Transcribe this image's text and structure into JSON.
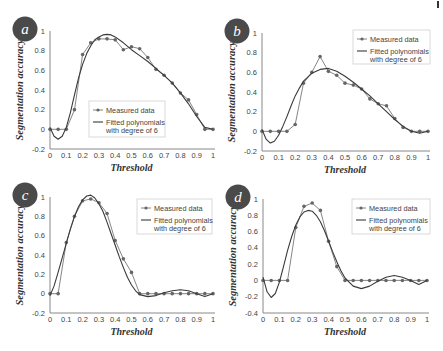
{
  "figure": {
    "corner_mark": true
  },
  "chart_data": [
    {
      "id": "a",
      "panel_label": "a",
      "type": "line",
      "title": "",
      "xlabel": "Threshold",
      "ylabel": "Segmentation accuracy",
      "xlim": [
        0,
        1
      ],
      "ylim": [
        -0.2,
        1
      ],
      "xticks": [
        "0",
        "0.1",
        "0.2",
        "0.3",
        "0.4",
        "0.5",
        "0.6",
        "0.7",
        "0.8",
        "0.9",
        "1"
      ],
      "yticks": [
        "-0.2",
        "0",
        "0.2",
        "0.4",
        "0.6",
        "0.8",
        "1"
      ],
      "grid": false,
      "legend": {
        "position": "lower-center",
        "entries": [
          "Measured data",
          "Fitted polynomials with degree of 6"
        ]
      },
      "series": [
        {
          "name": "Measured data",
          "style": "line-marker",
          "x": [
            0,
            0.05,
            0.1,
            0.15,
            0.2,
            0.25,
            0.3,
            0.35,
            0.4,
            0.45,
            0.5,
            0.55,
            0.6,
            0.65,
            0.7,
            0.75,
            0.8,
            0.85,
            0.9,
            0.95,
            1
          ],
          "y": [
            0,
            0,
            0,
            0.2,
            0.76,
            0.88,
            0.92,
            0.92,
            0.91,
            0.81,
            0.84,
            0.82,
            0.73,
            0.61,
            0.55,
            0.47,
            0.37,
            0.3,
            0.15,
            0,
            0
          ]
        },
        {
          "name": "Fitted polynomials with degree of 6",
          "style": "line",
          "x": [
            0,
            0.025,
            0.05,
            0.075,
            0.1,
            0.125,
            0.15,
            0.175,
            0.2,
            0.225,
            0.25,
            0.275,
            0.3,
            0.325,
            0.35,
            0.375,
            0.4,
            0.45,
            0.5,
            0.55,
            0.6,
            0.65,
            0.7,
            0.75,
            0.8,
            0.85,
            0.9,
            0.95,
            1
          ],
          "y": [
            0.02,
            -0.07,
            -0.1,
            -0.07,
            0.02,
            0.17,
            0.35,
            0.52,
            0.66,
            0.77,
            0.85,
            0.91,
            0.94,
            0.96,
            0.965,
            0.96,
            0.94,
            0.88,
            0.81,
            0.75,
            0.69,
            0.62,
            0.55,
            0.47,
            0.37,
            0.26,
            0.13,
            0.02,
            0
          ]
        }
      ],
      "legend_box": {
        "x": 89,
        "y": 101,
        "w": 76,
        "h": 36
      },
      "plot": {
        "x0": 50,
        "x1": 213,
        "y_top": 31,
        "y_bottom": 149
      }
    },
    {
      "id": "b",
      "panel_label": "b",
      "type": "line",
      "title": "",
      "xlabel": "Threshold",
      "ylabel": "Segmentation accuracy",
      "xlim": [
        0,
        1
      ],
      "ylim": [
        -0.2,
        1
      ],
      "xticks": [
        "0",
        "0.1",
        "0.2",
        "0.3",
        "0.4",
        "0.5",
        "0.6",
        "0.7",
        "0.8",
        "0.9",
        "1"
      ],
      "yticks": [
        "-0.2",
        "0",
        "0.2",
        "0.4",
        "0.6",
        "0.8",
        "1"
      ],
      "grid": false,
      "legend": {
        "position": "upper-right",
        "entries": [
          "Measured data",
          "Fitted polynomials with degree of 6"
        ]
      },
      "series": [
        {
          "name": "Measured data",
          "style": "line-marker",
          "x": [
            0,
            0.05,
            0.1,
            0.15,
            0.2,
            0.25,
            0.3,
            0.35,
            0.4,
            0.45,
            0.5,
            0.55,
            0.6,
            0.65,
            0.7,
            0.75,
            0.8,
            0.85,
            0.9,
            0.95,
            1
          ],
          "y": [
            0,
            0,
            0,
            0,
            0.07,
            0.49,
            0.6,
            0.76,
            0.61,
            0.57,
            0.49,
            0.47,
            0.43,
            0.33,
            0.28,
            0.26,
            0.13,
            0.04,
            0,
            0,
            0
          ]
        },
        {
          "name": "Fitted polynomials with degree of 6",
          "style": "line",
          "x": [
            0,
            0.025,
            0.05,
            0.075,
            0.1,
            0.125,
            0.15,
            0.175,
            0.2,
            0.225,
            0.25,
            0.3,
            0.35,
            0.4,
            0.45,
            0.5,
            0.55,
            0.6,
            0.65,
            0.7,
            0.75,
            0.8,
            0.85,
            0.9,
            0.95,
            1
          ],
          "y": [
            0.02,
            -0.08,
            -0.12,
            -0.1,
            -0.04,
            0.05,
            0.15,
            0.26,
            0.36,
            0.44,
            0.51,
            0.59,
            0.63,
            0.64,
            0.61,
            0.56,
            0.5,
            0.43,
            0.36,
            0.28,
            0.2,
            0.12,
            0.05,
            0.0,
            -0.02,
            0
          ]
        }
      ],
      "legend_box": {
        "x": 353,
        "y": 30,
        "w": 77,
        "h": 34
      },
      "plot": {
        "x0": 262,
        "x1": 428,
        "y_top": 33,
        "y_bottom": 151
      }
    },
    {
      "id": "c",
      "panel_label": "c",
      "type": "line",
      "title": "",
      "xlabel": "Threshold",
      "ylabel": "Segmentation accuracy",
      "xlim": [
        0,
        1
      ],
      "ylim": [
        -0.2,
        1
      ],
      "xticks": [
        "0",
        "0.1",
        "0.2",
        "0.3",
        "0.4",
        "0.5",
        "0.6",
        "0.7",
        "0.8",
        "0.9",
        "1"
      ],
      "yticks": [
        "-0.2",
        "0",
        "0.2",
        "0.4",
        "0.6",
        "0.8",
        "1"
      ],
      "grid": false,
      "legend": {
        "position": "upper-right",
        "entries": [
          "Measured data",
          "Fitted polynomials with degree of 6"
        ]
      },
      "series": [
        {
          "name": "Measured data",
          "style": "line-marker",
          "x": [
            0,
            0.05,
            0.1,
            0.15,
            0.2,
            0.25,
            0.3,
            0.35,
            0.4,
            0.45,
            0.5,
            0.55,
            0.6,
            0.65,
            0.7,
            0.75,
            0.8,
            0.85,
            0.9,
            0.95,
            1
          ],
          "y": [
            0,
            0,
            0.53,
            0.8,
            0.96,
            0.98,
            0.94,
            0.83,
            0.55,
            0.36,
            0.22,
            0,
            0,
            0,
            0,
            0,
            0,
            0,
            0,
            0,
            0
          ]
        },
        {
          "name": "Fitted polynomials with degree of 6",
          "style": "line",
          "x": [
            0,
            0.025,
            0.05,
            0.075,
            0.1,
            0.125,
            0.15,
            0.175,
            0.2,
            0.225,
            0.25,
            0.275,
            0.3,
            0.325,
            0.35,
            0.375,
            0.4,
            0.425,
            0.45,
            0.475,
            0.5,
            0.525,
            0.55,
            0.6,
            0.65,
            0.7,
            0.75,
            0.8,
            0.85,
            0.9,
            0.95,
            1
          ],
          "y": [
            -0.02,
            0.08,
            0.22,
            0.37,
            0.52,
            0.67,
            0.8,
            0.9,
            0.97,
            1.01,
            1.02,
            0.99,
            0.93,
            0.85,
            0.74,
            0.62,
            0.5,
            0.38,
            0.27,
            0.17,
            0.09,
            0.03,
            -0.01,
            -0.03,
            -0.02,
            0.01,
            0.03,
            0.04,
            0.03,
            0.0,
            -0.03,
            0
          ]
        }
      ],
      "legend_box": {
        "x": 137,
        "y": 199,
        "w": 75,
        "h": 35
      },
      "plot": {
        "x0": 50,
        "x1": 213,
        "y_top": 197,
        "y_bottom": 313
      }
    },
    {
      "id": "d",
      "panel_label": "d",
      "type": "line",
      "title": "",
      "xlabel": "Threshold",
      "ylabel": "Segmentation accuracy",
      "xlim": [
        0,
        1
      ],
      "ylim": [
        -0.4,
        1
      ],
      "xticks": [
        "0",
        "0.1",
        "0.2",
        "0.3",
        "0.4",
        "0.5",
        "0.6",
        "0.7",
        "0.8",
        "0.9",
        "1"
      ],
      "yticks": [
        "-0.4",
        "-0.2",
        "0",
        "0.2",
        "0.4",
        "0.6",
        "0.8",
        "1"
      ],
      "grid": false,
      "legend": {
        "position": "upper-right",
        "entries": [
          "Measured data",
          "Fitted polynomials with degree of 6"
        ]
      },
      "series": [
        {
          "name": "Measured data",
          "style": "line-marker",
          "x": [
            0,
            0.05,
            0.1,
            0.15,
            0.2,
            0.25,
            0.3,
            0.35,
            0.4,
            0.45,
            0.5,
            0.55,
            0.6,
            0.65,
            0.7,
            0.75,
            0.8,
            0.85,
            0.9,
            0.95,
            1
          ],
          "y": [
            0,
            0,
            0,
            0,
            0.65,
            0.91,
            0.95,
            0.86,
            0.48,
            0.17,
            0,
            0,
            0,
            0,
            0,
            0,
            0,
            0,
            0,
            0,
            0
          ]
        },
        {
          "name": "Fitted polynomials with degree of 6",
          "style": "line",
          "x": [
            0,
            0.025,
            0.05,
            0.075,
            0.1,
            0.125,
            0.15,
            0.175,
            0.2,
            0.225,
            0.25,
            0.275,
            0.3,
            0.325,
            0.35,
            0.375,
            0.4,
            0.425,
            0.45,
            0.475,
            0.5,
            0.55,
            0.6,
            0.65,
            0.7,
            0.75,
            0.8,
            0.85,
            0.9,
            0.95,
            1
          ],
          "y": [
            0.04,
            -0.14,
            -0.21,
            -0.16,
            -0.02,
            0.17,
            0.37,
            0.54,
            0.68,
            0.78,
            0.84,
            0.86,
            0.85,
            0.8,
            0.72,
            0.61,
            0.48,
            0.35,
            0.23,
            0.12,
            0.03,
            -0.07,
            -0.1,
            -0.07,
            -0.01,
            0.04,
            0.06,
            0.04,
            0.0,
            -0.05,
            0
          ]
        }
      ],
      "legend_box": {
        "x": 352,
        "y": 199,
        "w": 78,
        "h": 35
      },
      "plot": {
        "x0": 263,
        "x1": 427,
        "y_top": 199,
        "y_bottom": 313
      }
    }
  ],
  "colors": {
    "badge": "#4a4a4a",
    "line": "#555555",
    "axis": "#888888",
    "marker": "#666666"
  }
}
